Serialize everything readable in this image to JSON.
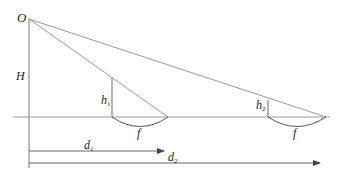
{
  "diagram": {
    "labels": {
      "origin": "O",
      "height": "H",
      "h1_base": "h",
      "h1_sub": "1",
      "h2_base": "h",
      "h2_sub": "2",
      "f1": "f",
      "f2": "f",
      "d1_base": "d",
      "d1_sub": "1",
      "d2_base": "d",
      "d2_sub": "2"
    },
    "colors": {
      "line": "#8a8a8a",
      "dark_line": "#555555",
      "text": "#222222"
    }
  }
}
